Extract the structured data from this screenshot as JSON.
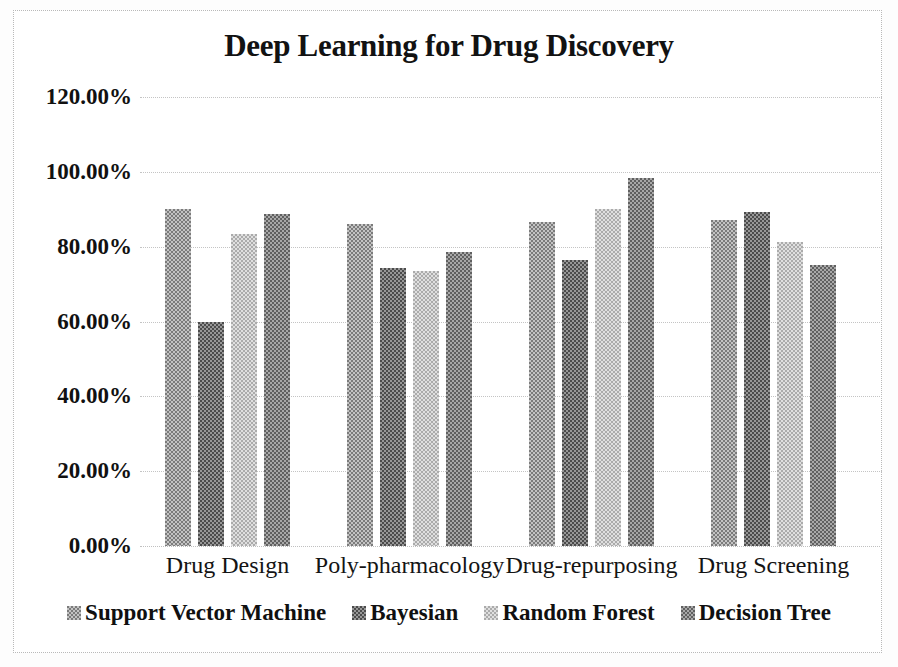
{
  "chart_data": {
    "type": "bar",
    "title": "Deep Learning for Drug Discovery",
    "xlabel": "",
    "ylabel": "",
    "ylim": [
      0,
      120
    ],
    "ytick_labels": [
      "120.00%",
      "100.00%",
      "80.00%",
      "60.00%",
      "40.00%",
      "20.00%",
      "0.00%"
    ],
    "ytick_values": [
      120,
      100,
      80,
      60,
      40,
      20,
      0
    ],
    "grid": true,
    "legend_position": "bottom",
    "categories": [
      "Drug Design",
      "Poly-pharmacology",
      "Drug-repurposing",
      "Drug Screening"
    ],
    "series": [
      {
        "name": "Support Vector Machine",
        "color": "#7b7b7b",
        "values": [
          90.0,
          86.0,
          86.7,
          87.0
        ]
      },
      {
        "name": "Bayesian",
        "color": "#4b4b4b",
        "values": [
          60.0,
          74.2,
          76.5,
          89.2
        ]
      },
      {
        "name": "Random Forest",
        "color": "#ababab",
        "values": [
          83.5,
          73.6,
          90.0,
          81.3
        ]
      },
      {
        "name": "Decision Tree",
        "color": "#606060",
        "values": [
          88.8,
          78.5,
          98.3,
          75.0
        ]
      }
    ]
  }
}
